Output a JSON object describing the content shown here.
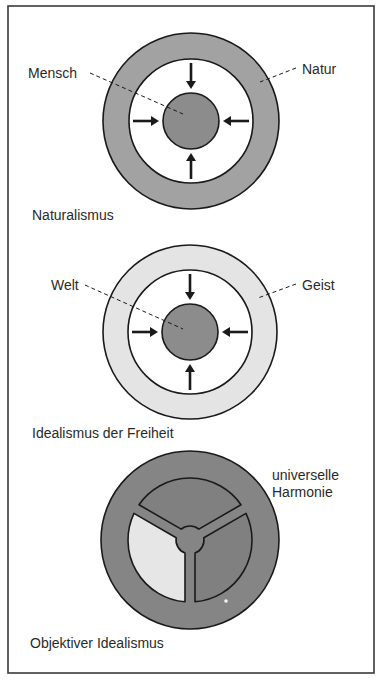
{
  "frame": {
    "x": 8,
    "y": 6,
    "width": 366,
    "height": 667,
    "stroke": "#3a3a3a"
  },
  "colors": {
    "ink": "#1a1a1a",
    "text": "#2a2a2a",
    "natur_ring": "#a2a2a2",
    "core": "#8c8c8c",
    "geist_ring": "#e4e4e4",
    "harmonie_disc": "#858585",
    "harmonie_segment_dark": "#808080",
    "harmonie_segment_light": "#e6e6e6"
  },
  "diagrams": [
    {
      "id": "naturalismus",
      "title": "Naturalismus",
      "center": [
        191,
        121
      ],
      "outer_r": 88,
      "inner_r": 62,
      "core_r": 28,
      "ring_fill_key": "natur_ring",
      "labels": [
        {
          "text": "Mensch",
          "x": 28,
          "y": 78,
          "line": [
            [
              90,
              73
            ],
            [
              183,
              114
            ]
          ]
        },
        {
          "text": "Natur",
          "x": 302,
          "y": 74,
          "line": [
            [
              296,
              68
            ],
            [
              260,
              82
            ]
          ]
        }
      ],
      "title_pos": [
        32,
        220
      ]
    },
    {
      "id": "idealismus-der-freiheit",
      "title": "Idealismus der Freiheit",
      "center": [
        190,
        332
      ],
      "outer_r": 87,
      "inner_r": 62,
      "core_r": 28,
      "ring_fill_key": "geist_ring",
      "labels": [
        {
          "text": "Welt",
          "x": 51,
          "y": 290,
          "line": [
            [
              85,
              285
            ],
            [
              183,
              329
            ]
          ]
        },
        {
          "text": "Geist",
          "x": 302,
          "y": 290,
          "line": [
            [
              296,
              284
            ],
            [
              258,
              298
            ]
          ]
        }
      ],
      "title_pos": [
        32,
        438
      ]
    },
    {
      "id": "objektiver-idealismus",
      "title": "Objektiver Idealismus",
      "center": [
        190,
        540
      ],
      "outer_r": 89,
      "inner_r": 62,
      "hub_r": 14,
      "spoke_half_width": 5,
      "light_segment": "left",
      "labels": [
        {
          "text": "universelle",
          "x": 272,
          "y": 480
        },
        {
          "text": "Harmonie",
          "x": 272,
          "y": 497
        }
      ],
      "title_pos": [
        30,
        648
      ]
    }
  ]
}
